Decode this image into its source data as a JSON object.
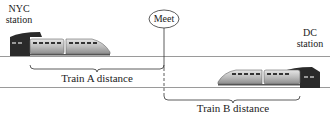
{
  "diagram": {
    "nyc_station": {
      "line1": "NYC",
      "line2": "station"
    },
    "dc_station": {
      "line1": "DC",
      "line2": "station"
    },
    "meet_label": "Meet",
    "train_a_label": "Train A distance",
    "train_b_label": "Train B distance",
    "icons": {
      "train_a": "train-icon",
      "train_b": "train-icon",
      "nyc_station_building": "station-building-icon",
      "dc_station_building": "station-building-icon"
    },
    "colors": {
      "track": "#9a9a9a",
      "line": "#333333",
      "train_body": "#c8c8c8",
      "station_building": "#2a2a2a"
    }
  }
}
